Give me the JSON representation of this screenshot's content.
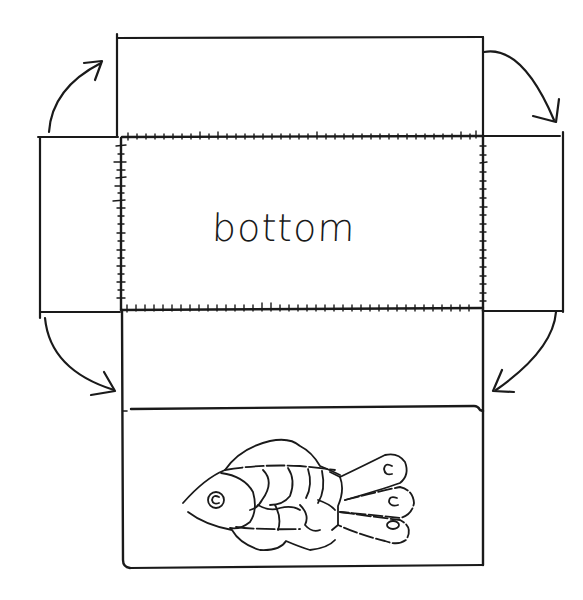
{
  "diagram": {
    "type": "box-net",
    "center_panel": {
      "label": "bottom"
    },
    "panels": [
      {
        "id": "top-flap",
        "label": ""
      },
      {
        "id": "left-flap",
        "label": ""
      },
      {
        "id": "bottom",
        "label": "bottom"
      },
      {
        "id": "right-flap",
        "label": ""
      },
      {
        "id": "front-inner",
        "label": ""
      },
      {
        "id": "front-fish-panel",
        "label": "",
        "illustration": "fish"
      }
    ],
    "arrows": [
      {
        "from": "left-flap",
        "to": "top-flap",
        "direction": "fold-up"
      },
      {
        "from": "top-flap",
        "to": "right-flap",
        "direction": "fold-down"
      },
      {
        "from": "left-flap",
        "to": "front-inner",
        "direction": "fold-down"
      },
      {
        "from": "right-flap",
        "to": "front-inner",
        "direction": "fold-down"
      }
    ],
    "ink_color": "#1a1a1a",
    "background": "#ffffff"
  }
}
